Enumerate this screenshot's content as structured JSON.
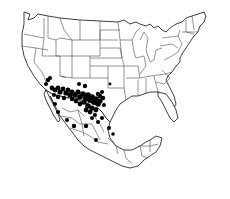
{
  "map": {
    "title": "",
    "region": "United States and Mexico",
    "background": "#ffffff",
    "line_color": "#2a2a2a",
    "dot_color": "#000000",
    "legend": null
  },
  "occurrences": [
    {
      "x": 48,
      "y": 80,
      "r": 2.2
    },
    {
      "x": 46,
      "y": 84,
      "r": 2.0
    },
    {
      "x": 50,
      "y": 78,
      "r": 2.0
    },
    {
      "x": 52,
      "y": 88,
      "r": 2.4
    },
    {
      "x": 55,
      "y": 90,
      "r": 2.4
    },
    {
      "x": 58,
      "y": 88,
      "r": 2.4
    },
    {
      "x": 60,
      "y": 92,
      "r": 2.6
    },
    {
      "x": 63,
      "y": 89,
      "r": 2.4
    },
    {
      "x": 66,
      "y": 93,
      "r": 2.6
    },
    {
      "x": 68,
      "y": 90,
      "r": 2.4
    },
    {
      "x": 70,
      "y": 95,
      "r": 2.6
    },
    {
      "x": 72,
      "y": 92,
      "r": 2.6
    },
    {
      "x": 75,
      "y": 95,
      "r": 2.8
    },
    {
      "x": 78,
      "y": 92,
      "r": 2.6
    },
    {
      "x": 80,
      "y": 97,
      "r": 2.8
    },
    {
      "x": 83,
      "y": 94,
      "r": 2.8
    },
    {
      "x": 86,
      "y": 98,
      "r": 3.0
    },
    {
      "x": 88,
      "y": 95,
      "r": 2.8
    },
    {
      "x": 90,
      "y": 100,
      "r": 3.0
    },
    {
      "x": 92,
      "y": 97,
      "r": 2.8
    },
    {
      "x": 94,
      "y": 102,
      "r": 3.0
    },
    {
      "x": 96,
      "y": 99,
      "r": 2.8
    },
    {
      "x": 98,
      "y": 104,
      "r": 2.8
    },
    {
      "x": 100,
      "y": 101,
      "r": 2.6
    },
    {
      "x": 84,
      "y": 102,
      "r": 2.8
    },
    {
      "x": 88,
      "y": 106,
      "r": 2.8
    },
    {
      "x": 92,
      "y": 108,
      "r": 2.6
    },
    {
      "x": 96,
      "y": 110,
      "r": 2.4
    },
    {
      "x": 90,
      "y": 112,
      "r": 2.4
    },
    {
      "x": 86,
      "y": 110,
      "r": 2.4
    },
    {
      "x": 80,
      "y": 104,
      "r": 2.4
    },
    {
      "x": 76,
      "y": 101,
      "r": 2.4
    },
    {
      "x": 72,
      "y": 99,
      "r": 2.2
    },
    {
      "x": 64,
      "y": 98,
      "r": 2.2
    },
    {
      "x": 58,
      "y": 97,
      "r": 2.2
    },
    {
      "x": 54,
      "y": 95,
      "r": 2.0
    },
    {
      "x": 85,
      "y": 86,
      "r": 2.2
    },
    {
      "x": 79,
      "y": 84,
      "r": 2.0
    },
    {
      "x": 100,
      "y": 96,
      "r": 2.2
    },
    {
      "x": 103,
      "y": 98,
      "r": 2.2
    },
    {
      "x": 102,
      "y": 92,
      "r": 2.0
    },
    {
      "x": 98,
      "y": 94,
      "r": 2.2
    },
    {
      "x": 104,
      "y": 105,
      "r": 2.0
    },
    {
      "x": 95,
      "y": 115,
      "r": 2.0
    },
    {
      "x": 92,
      "y": 118,
      "r": 2.0
    },
    {
      "x": 55,
      "y": 104,
      "r": 2.0
    },
    {
      "x": 58,
      "y": 112,
      "r": 2.0
    },
    {
      "x": 67,
      "y": 120,
      "r": 2.0
    },
    {
      "x": 74,
      "y": 126,
      "r": 2.2
    },
    {
      "x": 86,
      "y": 126,
      "r": 2.2
    },
    {
      "x": 98,
      "y": 122,
      "r": 2.0
    },
    {
      "x": 102,
      "y": 118,
      "r": 2.0
    },
    {
      "x": 109,
      "y": 128,
      "r": 2.0
    },
    {
      "x": 113,
      "y": 134,
      "r": 1.8
    },
    {
      "x": 96,
      "y": 140,
      "r": 2.0
    },
    {
      "x": 110,
      "y": 84,
      "r": 1.4
    }
  ]
}
